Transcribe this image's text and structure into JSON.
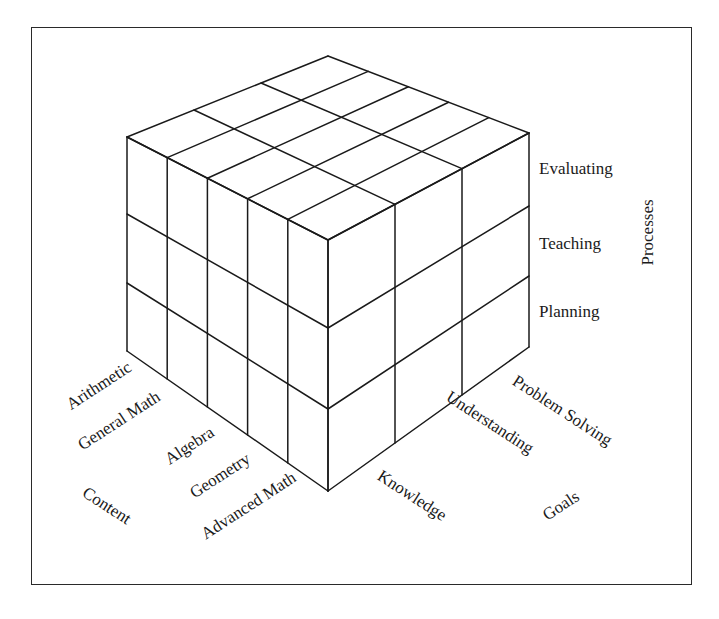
{
  "diagram": {
    "type": "3d-cube-matrix",
    "line_color": "#1a1a1a",
    "axes": {
      "content": {
        "title": "Content",
        "items": [
          "Arithmetic",
          "General Math",
          "Algebra",
          "Geometry",
          "Advanced Math"
        ]
      },
      "goals": {
        "title": "Goals",
        "items": [
          "Knowledge",
          "Understanding",
          "Problem Solving"
        ]
      },
      "processes": {
        "title": "Processes",
        "items": [
          "Evaluating",
          "Teaching",
          "Planning"
        ]
      }
    },
    "vertices": {
      "top_back": [
        328,
        56
      ],
      "top_left": [
        127,
        137
      ],
      "top_right": [
        529,
        133
      ],
      "top_front": [
        328,
        240
      ],
      "bottom_left": [
        127,
        351
      ],
      "bottom_right": [
        529,
        347
      ],
      "bottom_front": [
        328,
        491
      ]
    },
    "left_face_rows_y_left": [
      137,
      214,
      283,
      351
    ],
    "left_face_rows_y_front": [
      240,
      328,
      409,
      491
    ],
    "right_face_rows_y_right": [
      133,
      206,
      276,
      347
    ]
  }
}
